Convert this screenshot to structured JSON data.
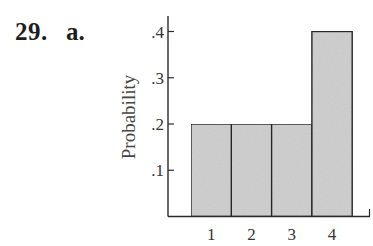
{
  "header": {
    "problem_number": "29.",
    "part_label": "a."
  },
  "chart_data": {
    "type": "bar",
    "title": "",
    "xlabel": "",
    "ylabel": "Probability",
    "categories": [
      "1",
      "2",
      "3",
      "4"
    ],
    "values": [
      0.2,
      0.2,
      0.2,
      0.4
    ],
    "yticks": [
      ".1",
      ".2",
      ".3",
      ".4"
    ],
    "ytick_values": [
      0.1,
      0.2,
      0.3,
      0.4
    ],
    "ylim": [
      0,
      0.42
    ],
    "grid": false,
    "legend": null,
    "colors": {
      "bar_fill": "#d2d2d2",
      "bar_stroke": "#2b2b2b",
      "axis": "#2b2b2b"
    }
  }
}
